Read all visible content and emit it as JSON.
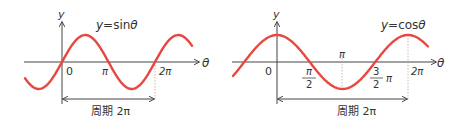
{
  "colors": {
    "curve": "#e8473f",
    "axis": "#444444",
    "text": "#333333",
    "guide": "#c9a0a0"
  },
  "graphs": [
    {
      "id": "sine",
      "equation": "y=sinθ",
      "y_axis_label": "y",
      "x_axis_label": "θ",
      "origin_label": "0",
      "ticks": [
        {
          "label": "π"
        },
        {
          "label": "2π"
        }
      ],
      "period_label": "周期 2π"
    },
    {
      "id": "cosine",
      "equation": "y=cosθ",
      "y_axis_label": "y",
      "x_axis_label": "θ",
      "origin_label": "0",
      "ticks": [
        {
          "label_num": "π",
          "label_den": "2"
        },
        {
          "label": "π"
        },
        {
          "label_num": "3",
          "label_den": "2",
          "label_suffix": "π"
        },
        {
          "label": "2π"
        }
      ],
      "period_label": "周期 2π"
    }
  ]
}
